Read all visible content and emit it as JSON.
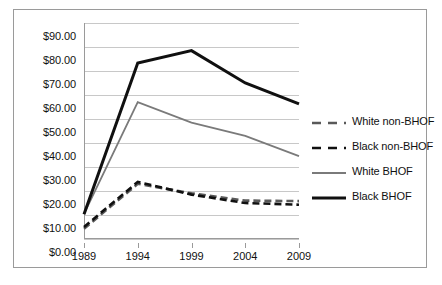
{
  "chart_data": {
    "type": "line",
    "title": "",
    "subtitle": "",
    "xlabel": "",
    "ylabel": "",
    "x": [
      1989,
      1994,
      1999,
      2004,
      2009
    ],
    "xticklabels": [
      "1989",
      "1994",
      "1999",
      "2004",
      "2009"
    ],
    "yticklabels": [
      "$0.00",
      "$10.00",
      "$20.00",
      "$30.00",
      "$40.00",
      "$50.00",
      "$60.00",
      "$70.00",
      "$80.00",
      "$90.00"
    ],
    "yticks": [
      0,
      10,
      20,
      30,
      40,
      50,
      60,
      70,
      80,
      90
    ],
    "ylim": [
      0,
      90
    ],
    "xlim": [
      1989,
      2009
    ],
    "grid": "horizontal",
    "legend_position": "right",
    "series": [
      {
        "name": "White non-BHOF",
        "values": [
          4.3,
          23.0,
          19.0,
          16.0,
          15.8
        ],
        "color": "#595959",
        "style": "dashed",
        "width": 2.6
      },
      {
        "name": "Black non-BHOF",
        "values": [
          5.0,
          23.8,
          18.5,
          15.0,
          14.3
        ],
        "color": "#101010",
        "style": "dashed",
        "width": 2.6
      },
      {
        "name": "White BHOF",
        "values": [
          10.5,
          57.0,
          48.5,
          43.0,
          34.5
        ],
        "color": "#7a7a7a",
        "style": "solid",
        "width": 1.8
      },
      {
        "name": "Black BHOF",
        "values": [
          10.3,
          73.3,
          78.5,
          65.0,
          56.3
        ],
        "color": "#101010",
        "style": "solid",
        "width": 3.0
      }
    ]
  },
  "legend": {
    "entries": [
      {
        "label": "White non-BHOF"
      },
      {
        "label": "Black non-BHOF"
      },
      {
        "label": "White BHOF"
      },
      {
        "label": "Black BHOF"
      }
    ]
  },
  "axes": {
    "y_axis_name": "y-axis",
    "x_axis_name": "x-axis"
  }
}
